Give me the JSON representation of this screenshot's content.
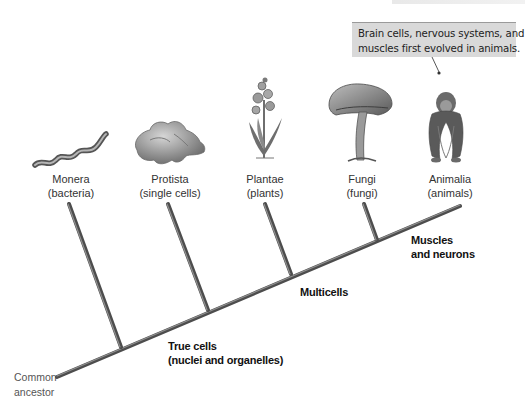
{
  "callout": {
    "line1": "Brain cells, nervous systems, and",
    "line2": "muscles first evolved in animals."
  },
  "kingdoms": [
    {
      "name": "Monera",
      "common": "(bacteria)",
      "icon": "bacteria-illustration"
    },
    {
      "name": "Protista",
      "common": "(single cells)",
      "icon": "protist-illustration"
    },
    {
      "name": "Plantae",
      "common": "(plants)",
      "icon": "plant-illustration"
    },
    {
      "name": "Fungi",
      "common": "(fungi)",
      "icon": "mushroom-illustration"
    },
    {
      "name": "Animalia",
      "common": "(animals)",
      "icon": "chimpanzee-illustration"
    }
  ],
  "traits": [
    {
      "line1": "True cells",
      "line2": "(nuclei and organelles)"
    },
    {
      "line1": "Multicells",
      "line2": ""
    },
    {
      "line1": "Muscles",
      "line2": "and neurons"
    }
  ],
  "root": {
    "line1": "Common",
    "line2": "ancestor"
  },
  "colors": {
    "branch": "#555555",
    "branch_highlight": "#8a8a8a",
    "callout_bg": "#d9d9d9",
    "label_text": "#333333"
  }
}
